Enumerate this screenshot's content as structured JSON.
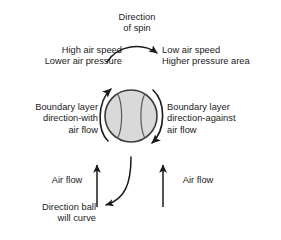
{
  "diagram": {
    "width": 281,
    "height": 240,
    "background_color": "#ffffff",
    "ink_color": "#1a1a1a",
    "ball": {
      "name": "spinning-ball",
      "center_x": 131,
      "center_y": 116,
      "radius": 26,
      "fill_color": "#d9d9d9",
      "outline_color": "#333333",
      "seam_color": "#555555",
      "seam_count": 2
    },
    "labels": {
      "spin": "Direction\nof spin",
      "high_speed": "High air speed\nLower air pressure",
      "low_speed": "Low air speed\nHigher pressure area",
      "boundary_with": "Boundary layer\ndirection-with\nair flow",
      "boundary_against": "Boundary layer\ndirection-against\nair flow",
      "airflow_left": "Air flow",
      "airflow_right": "Air flow",
      "ball_curve": "Direction ball\nwill curve"
    },
    "arrows": [
      {
        "name": "spin-direction-arrow",
        "shape": "curved",
        "from": [
          112,
          58
        ],
        "to": [
          158,
          57
        ],
        "points_to": "right",
        "describes": "Direction of spin"
      },
      {
        "name": "ball-rotation-arrow-left",
        "shape": "arc",
        "side": "left",
        "points_to": "up",
        "describes": "Boundary layer direction-with air flow"
      },
      {
        "name": "ball-rotation-arrow-right",
        "shape": "arc",
        "side": "right",
        "points_to": "down",
        "describes": "Boundary layer direction-against air flow"
      },
      {
        "name": "airflow-arrow-left",
        "shape": "straight",
        "from": [
          97,
          206
        ],
        "to": [
          97,
          163
        ],
        "points_to": "up",
        "describes": "Air flow"
      },
      {
        "name": "airflow-arrow-right",
        "shape": "straight",
        "from": [
          163,
          206
        ],
        "to": [
          163,
          163
        ],
        "points_to": "up",
        "describes": "Air flow"
      },
      {
        "name": "ball-curve-arrow",
        "shape": "curved",
        "from": [
          131,
          158
        ],
        "to": [
          103,
          206
        ],
        "points_to": "down-left",
        "describes": "Direction ball will curve"
      }
    ]
  }
}
